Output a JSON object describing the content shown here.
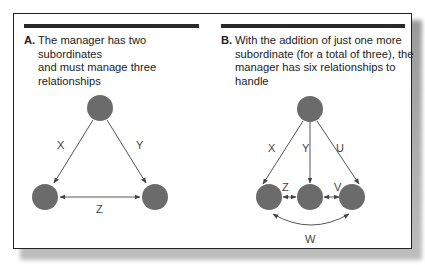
{
  "panels": [
    {
      "label": "A.",
      "caption": "The manager has two subordinates and must manage three relationships",
      "caption_lines": [
        "The manager has two subordinates",
        "and must manage three relationships"
      ],
      "relationships": [
        "X",
        "Y",
        "Z"
      ]
    },
    {
      "label": "B.",
      "caption": "With the addition of just one more subordinate (for a total of three), the manager has six relationships to handle",
      "caption_lines": [
        "With the addition of just one more",
        "subordinate (for a total of three), the",
        "manager has six relationships to handle"
      ],
      "relationships": [
        "X",
        "Y",
        "U",
        "Z",
        "V",
        "W"
      ]
    }
  ],
  "colors": {
    "node": "#6b6b6b",
    "line": "#555555",
    "bar": "#2a2a2a"
  }
}
